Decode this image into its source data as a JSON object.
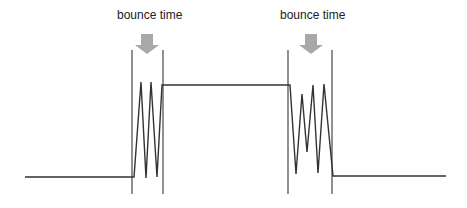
{
  "diagram": {
    "type": "switch-bounce-signal",
    "annotations": [
      {
        "id": "left",
        "label": "bounce time",
        "label_x": 117,
        "label_y": 8,
        "arrow_cx": 147
      },
      {
        "id": "right",
        "label": "bounce time",
        "label_x": 280,
        "label_y": 8,
        "arrow_cx": 311
      }
    ],
    "colors": {
      "signal": "#333333",
      "marker": "#555555",
      "arrow": "#a8a8a8",
      "text": "#222222"
    },
    "levels": {
      "low_y": 177,
      "high_y": 85
    },
    "signal_path": [
      [
        25,
        177
      ],
      [
        134,
        177
      ],
      [
        141,
        82
      ],
      [
        146,
        178
      ],
      [
        151,
        82
      ],
      [
        157,
        177
      ],
      [
        162,
        85
      ],
      [
        290,
        85
      ],
      [
        296,
        174
      ],
      [
        302,
        94
      ],
      [
        307,
        152
      ],
      [
        313,
        85
      ],
      [
        318,
        173
      ],
      [
        324,
        84
      ],
      [
        333,
        176
      ],
      [
        446,
        176
      ]
    ],
    "markers": [
      {
        "x": 132,
        "y1": 50,
        "y2": 194
      },
      {
        "x": 163,
        "y1": 50,
        "y2": 194
      },
      {
        "x": 288,
        "y1": 50,
        "y2": 194
      },
      {
        "x": 332,
        "y1": 50,
        "y2": 194
      }
    ]
  }
}
